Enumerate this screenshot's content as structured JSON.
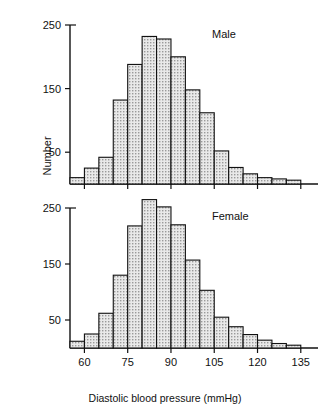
{
  "figure": {
    "y_axis_title": "Number",
    "x_axis_title": "Diastolic blood pressure (mmHg)",
    "panels": [
      {
        "key": "male",
        "label": "Male"
      },
      {
        "key": "female",
        "label": "Female"
      }
    ]
  },
  "chart_data": {
    "type": "bar",
    "title": "",
    "subtitle": "",
    "xlabel": "Diastolic blood pressure (mmHg)",
    "ylabel": "Number",
    "grid": false,
    "legend_position": "none",
    "annotations": [
      "Male",
      "Female"
    ],
    "bin_width": 5,
    "xlim": [
      55,
      137.5
    ],
    "x_tick_labels": [
      "60",
      "75",
      "90",
      "105",
      "120",
      "135"
    ],
    "x_tick_values": [
      60,
      75,
      90,
      105,
      120,
      135
    ],
    "panels": [
      {
        "name": "Male",
        "ylim": [
          0,
          260
        ],
        "y_tick_labels": [
          "50",
          "150",
          "250"
        ],
        "y_tick_values": [
          50,
          150,
          250
        ],
        "bins": [
          {
            "bin_start": 55,
            "bin_end": 60,
            "center": 57.5,
            "value": 10
          },
          {
            "bin_start": 60,
            "bin_end": 65,
            "center": 62.5,
            "value": 25
          },
          {
            "bin_start": 65,
            "bin_end": 70,
            "center": 67.5,
            "value": 42
          },
          {
            "bin_start": 70,
            "bin_end": 75,
            "center": 72.5,
            "value": 132
          },
          {
            "bin_start": 75,
            "bin_end": 80,
            "center": 77.5,
            "value": 188
          },
          {
            "bin_start": 80,
            "bin_end": 85,
            "center": 82.5,
            "value": 232
          },
          {
            "bin_start": 85,
            "bin_end": 90,
            "center": 87.5,
            "value": 228
          },
          {
            "bin_start": 90,
            "bin_end": 95,
            "center": 92.5,
            "value": 200
          },
          {
            "bin_start": 95,
            "bin_end": 100,
            "center": 97.5,
            "value": 148
          },
          {
            "bin_start": 100,
            "bin_end": 105,
            "center": 102.5,
            "value": 112
          },
          {
            "bin_start": 105,
            "bin_end": 110,
            "center": 107.5,
            "value": 52
          },
          {
            "bin_start": 110,
            "bin_end": 115,
            "center": 112.5,
            "value": 26
          },
          {
            "bin_start": 115,
            "bin_end": 120,
            "center": 117.5,
            "value": 16
          },
          {
            "bin_start": 120,
            "bin_end": 125,
            "center": 122.5,
            "value": 10
          },
          {
            "bin_start": 125,
            "bin_end": 130,
            "center": 127.5,
            "value": 8
          },
          {
            "bin_start": 130,
            "bin_end": 135,
            "center": 132.5,
            "value": 6
          }
        ]
      },
      {
        "name": "Female",
        "ylim": [
          0,
          280
        ],
        "y_tick_labels": [
          "50",
          "150",
          "250"
        ],
        "y_tick_values": [
          50,
          150,
          250
        ],
        "bins": [
          {
            "bin_start": 55,
            "bin_end": 60,
            "center": 57.5,
            "value": 12
          },
          {
            "bin_start": 60,
            "bin_end": 65,
            "center": 62.5,
            "value": 25
          },
          {
            "bin_start": 65,
            "bin_end": 70,
            "center": 67.5,
            "value": 62
          },
          {
            "bin_start": 70,
            "bin_end": 75,
            "center": 72.5,
            "value": 130
          },
          {
            "bin_start": 75,
            "bin_end": 80,
            "center": 77.5,
            "value": 218
          },
          {
            "bin_start": 80,
            "bin_end": 85,
            "center": 82.5,
            "value": 265
          },
          {
            "bin_start": 85,
            "bin_end": 90,
            "center": 87.5,
            "value": 252
          },
          {
            "bin_start": 90,
            "bin_end": 95,
            "center": 92.5,
            "value": 220
          },
          {
            "bin_start": 95,
            "bin_end": 100,
            "center": 97.5,
            "value": 157
          },
          {
            "bin_start": 100,
            "bin_end": 105,
            "center": 102.5,
            "value": 103
          },
          {
            "bin_start": 105,
            "bin_end": 110,
            "center": 107.5,
            "value": 55
          },
          {
            "bin_start": 110,
            "bin_end": 115,
            "center": 112.5,
            "value": 38
          },
          {
            "bin_start": 115,
            "bin_end": 120,
            "center": 117.5,
            "value": 24
          },
          {
            "bin_start": 120,
            "bin_end": 125,
            "center": 122.5,
            "value": 14
          },
          {
            "bin_start": 125,
            "bin_end": 130,
            "center": 127.5,
            "value": 8
          },
          {
            "bin_start": 130,
            "bin_end": 135,
            "center": 132.5,
            "value": 5
          }
        ]
      }
    ]
  }
}
